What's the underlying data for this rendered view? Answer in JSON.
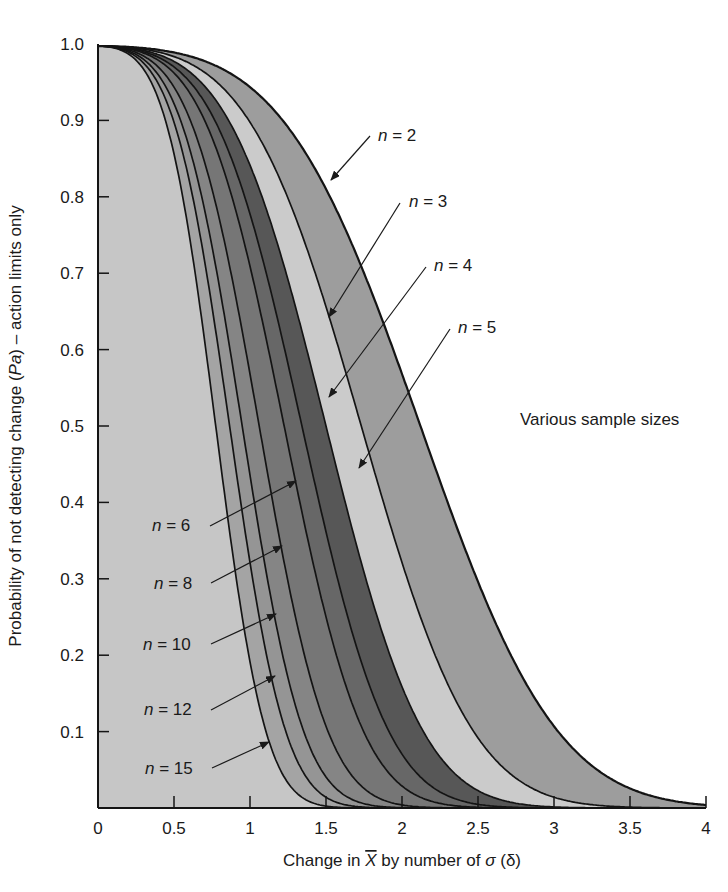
{
  "chart_data": {
    "type": "area",
    "title": "",
    "xlabel": "Change in X̅ by number of σ (δ)",
    "xlabel_parts": {
      "pre": "Change in ",
      "xbar": "X",
      "post": " by number of ",
      "sigma": "σ",
      "tail": " (δ)"
    },
    "ylabel": "Probability of not detecting change (Pa) – action limits only",
    "ylabel_parts": {
      "pre": "Probability of not detecting change (",
      "italic": "Pa",
      "post": ") – action limits only"
    },
    "xlim": [
      0,
      4
    ],
    "ylim": [
      0,
      1.0
    ],
    "x_ticks": [
      "0",
      "0.5",
      "1",
      "1.5",
      "2",
      "2.5",
      "3",
      "3.5",
      "4"
    ],
    "x_tick_values": [
      0,
      0.5,
      1,
      1.5,
      2,
      2.5,
      3,
      3.5,
      4
    ],
    "y_ticks": [
      "0.1",
      "0.2",
      "0.3",
      "0.4",
      "0.5",
      "0.6",
      "0.7",
      "0.8",
      "0.9",
      "1.0"
    ],
    "y_tick_values": [
      0.1,
      0.2,
      0.3,
      0.4,
      0.5,
      0.6,
      0.7,
      0.8,
      0.9,
      1.0
    ],
    "grid": false,
    "annotation": "Various sample sizes",
    "control_limit_k": 3,
    "formula": "Pa = Φ(3 − δ√n) − Φ(−3 − δ√n)",
    "series": [
      {
        "name": "n = 2",
        "n": 2,
        "label": "n = 2",
        "x_at_pa_0_5": 2.12,
        "fill": "#9d9d9d"
      },
      {
        "name": "n = 3",
        "n": 3,
        "label": "n = 3",
        "x_at_pa_0_5": 1.73,
        "fill": "#cbcbcb"
      },
      {
        "name": "n = 4",
        "n": 4,
        "label": "n = 4",
        "x_at_pa_0_5": 1.5,
        "fill": "#575757"
      },
      {
        "name": "n = 5",
        "n": 5,
        "label": "n = 5",
        "x_at_pa_0_5": 1.34,
        "fill": "#676767"
      },
      {
        "name": "n = 6",
        "n": 6,
        "label": "n = 6",
        "x_at_pa_0_5": 1.22,
        "fill": "#767676"
      },
      {
        "name": "n = 8",
        "n": 8,
        "label": "n = 8",
        "x_at_pa_0_5": 1.06,
        "fill": "#858585"
      },
      {
        "name": "n = 10",
        "n": 10,
        "label": "n = 10",
        "x_at_pa_0_5": 0.95,
        "fill": "#959595"
      },
      {
        "name": "n = 12",
        "n": 12,
        "label": "n = 12",
        "x_at_pa_0_5": 0.87,
        "fill": "#a4a4a4"
      },
      {
        "name": "n = 15",
        "n": 15,
        "label": "n = 15",
        "x_at_pa_0_5": 0.77,
        "fill": "#c6c6c6"
      }
    ]
  },
  "layout": {
    "plot": {
      "x0": 98,
      "x1": 706,
      "y0": 808,
      "y1": 44
    },
    "labels": [
      {
        "n": "n",
        "eq": " = 2",
        "x": 378,
        "y": 141,
        "line": [
          370,
          136,
          331,
          180
        ]
      },
      {
        "n": "n",
        "eq": " = 3",
        "x": 409,
        "y": 207,
        "line": [
          400,
          203,
          329,
          317
        ]
      },
      {
        "n": "n",
        "eq": " = 4",
        "x": 434,
        "y": 271,
        "line": [
          426,
          267,
          329,
          397
        ]
      },
      {
        "n": "n",
        "eq": " = 5",
        "x": 458,
        "y": 333,
        "line": [
          450,
          329,
          359,
          468
        ]
      },
      {
        "n": "n",
        "eq": " = 6",
        "x": 152,
        "y": 531,
        "line": [
          210,
          526,
          296,
          481
        ]
      },
      {
        "n": "n",
        "eq": " = 8",
        "x": 154,
        "y": 589,
        "line": [
          211,
          583,
          282,
          546
        ]
      },
      {
        "n": "n",
        "eq": " = 10",
        "x": 143,
        "y": 650,
        "line": [
          211,
          644,
          276,
          614
        ]
      },
      {
        "n": "n",
        "eq": " = 12",
        "x": 144,
        "y": 715,
        "line": [
          211,
          710,
          275,
          676
        ]
      },
      {
        "n": "n",
        "eq": " = 15",
        "x": 145,
        "y": 774,
        "line": [
          212,
          768,
          269,
          742
        ]
      }
    ],
    "various": {
      "x": 520,
      "y": 425
    }
  }
}
